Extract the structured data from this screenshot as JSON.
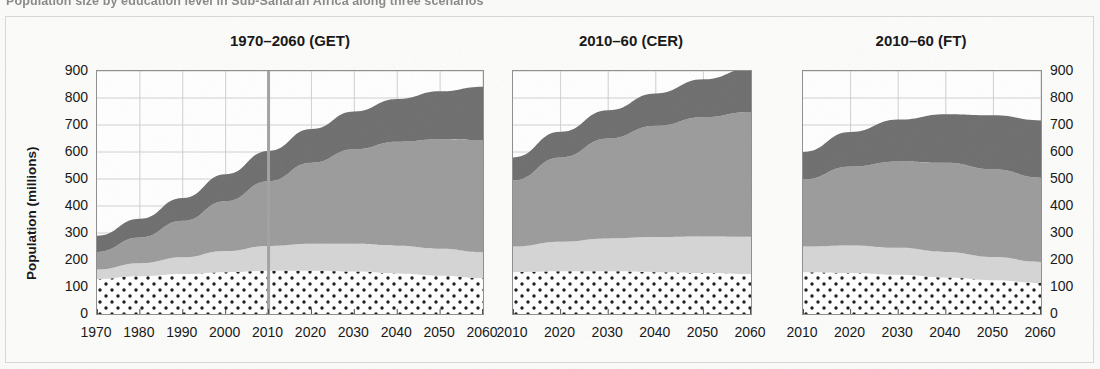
{
  "figure": {
    "caption": "Population size by education level in Sub-Saharan Africa along three scenarios",
    "ylabel": "Population (millions)",
    "background_color": "#fbfbfa",
    "frame_color": "#d8d8d6"
  },
  "axis": {
    "yticks": [
      0,
      100,
      200,
      300,
      400,
      500,
      600,
      700,
      800,
      900
    ],
    "ytick_labels": [
      "0",
      "100",
      "200",
      "300",
      "400",
      "500",
      "600",
      "700",
      "800",
      "900"
    ],
    "ylim": [
      0,
      900
    ],
    "grid": true,
    "grid_color": "#b9b9b9"
  },
  "series_style": {
    "no_education": {
      "label": "No education",
      "color": "#ffffff",
      "pattern": "dots",
      "dot_color": "#1a1a1a"
    },
    "primary": {
      "label": "Primary",
      "color": "#d5d5d5"
    },
    "secondary": {
      "label": "Secondary",
      "color": "#9b9b9b"
    },
    "tertiary": {
      "label": "Tertiary",
      "color": "#6e6e6e"
    }
  },
  "chart_data": [
    {
      "type": "area",
      "title": "1970–2060 (GET)",
      "xlabel": "",
      "ylabel": "Population (millions)",
      "ylim": [
        0,
        900
      ],
      "grid": true,
      "legend": "none",
      "x": [
        1970,
        1980,
        1990,
        2000,
        2010,
        2020,
        2030,
        2040,
        2050,
        2060
      ],
      "xtick_labels": [
        "1970",
        "1980",
        "1990",
        "2000",
        "2010",
        "2020",
        "2030",
        "2040",
        "2050",
        "2060"
      ],
      "reference_line_x": 2010,
      "series": [
        {
          "name": "No education",
          "values": [
            130,
            140,
            148,
            155,
            160,
            160,
            157,
            150,
            142,
            133
          ]
        },
        {
          "name": "Primary",
          "values": [
            35,
            48,
            62,
            78,
            92,
            100,
            103,
            103,
            100,
            96
          ]
        },
        {
          "name": "Secondary",
          "values": [
            65,
            95,
            135,
            185,
            240,
            300,
            350,
            385,
            405,
            415
          ]
        },
        {
          "name": "Tertiary",
          "values": [
            60,
            70,
            85,
            100,
            112,
            125,
            140,
            158,
            178,
            198
          ]
        }
      ],
      "totals": [
        290,
        353,
        430,
        518,
        604,
        685,
        750,
        796,
        825,
        842
      ]
    },
    {
      "type": "area",
      "title": "2010–60 (CER)",
      "xlabel": "",
      "ylabel": "",
      "ylim": [
        0,
        900
      ],
      "grid": true,
      "legend": "none",
      "x": [
        2010,
        2020,
        2030,
        2040,
        2050,
        2060
      ],
      "xtick_labels": [
        "2010",
        "2020",
        "2030",
        "2040",
        "2050",
        "2060"
      ],
      "series": [
        {
          "name": "No education",
          "values": [
            155,
            158,
            158,
            155,
            152,
            148
          ]
        },
        {
          "name": "Primary",
          "values": [
            95,
            110,
            122,
            130,
            135,
            138
          ]
        },
        {
          "name": "Secondary",
          "values": [
            245,
            312,
            370,
            412,
            442,
            462
          ]
        },
        {
          "name": "Tertiary",
          "values": [
            85,
            95,
            105,
            120,
            140,
            162
          ]
        }
      ],
      "totals": [
        580,
        675,
        755,
        817,
        869,
        910
      ]
    },
    {
      "type": "area",
      "title": "2010–60 (FT)",
      "xlabel": "",
      "ylabel": "",
      "ylim": [
        0,
        900
      ],
      "grid": true,
      "legend": "none",
      "x": [
        2010,
        2020,
        2030,
        2040,
        2050,
        2060
      ],
      "xtick_labels": [
        "2010",
        "2020",
        "2030",
        "2040",
        "2050",
        "2060"
      ],
      "series": [
        {
          "name": "No education",
          "values": [
            155,
            152,
            145,
            135,
            125,
            115
          ]
        },
        {
          "name": "Primary",
          "values": [
            95,
            102,
            100,
            95,
            86,
            78
          ]
        },
        {
          "name": "Secondary",
          "values": [
            248,
            292,
            320,
            330,
            325,
            312
          ]
        },
        {
          "name": "Tertiary",
          "values": [
            102,
            128,
            155,
            180,
            200,
            212
          ]
        }
      ],
      "totals": [
        600,
        674,
        720,
        740,
        736,
        717
      ]
    }
  ]
}
